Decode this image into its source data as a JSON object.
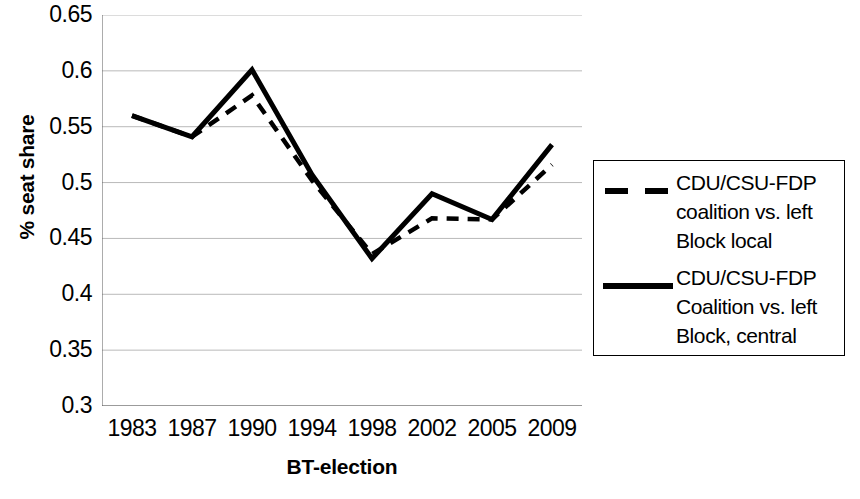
{
  "chart_data": {
    "type": "line",
    "title": "",
    "xlabel": "BT-election",
    "ylabel": "% seat share",
    "categories": [
      "1983",
      "1987",
      "1990",
      "1994",
      "1998",
      "2002",
      "2005",
      "2009"
    ],
    "ylim": [
      0.3,
      0.65
    ],
    "yticks": [
      "0.65",
      "0.6",
      "0.55",
      "0.5",
      "0.45",
      "0.4",
      "0.35",
      "0.3"
    ],
    "ytick_values": [
      0.65,
      0.6,
      0.55,
      0.5,
      0.45,
      0.4,
      0.35,
      0.3
    ],
    "grid": true,
    "legend_position": "right",
    "series": [
      {
        "name": "CDU/CSU-FDP coalition vs. left Block local",
        "style": "dashed",
        "color": "#000000",
        "values": [
          0.56,
          0.541,
          0.578,
          0.502,
          0.436,
          0.468,
          0.467,
          0.516
        ]
      },
      {
        "name": "CDU/CSU-FDP Coalition vs. left Block, central",
        "style": "solid",
        "color": "#000000",
        "values": [
          0.56,
          0.541,
          0.601,
          0.507,
          0.432,
          0.49,
          0.467,
          0.534
        ]
      }
    ]
  },
  "legend": {
    "entries": [
      {
        "label": "CDU/CSU-FDP coalition vs. left Block local",
        "style": "dashed"
      },
      {
        "label": "CDU/CSU-FDP Coalition vs. left Block, central",
        "style": "solid"
      }
    ]
  }
}
